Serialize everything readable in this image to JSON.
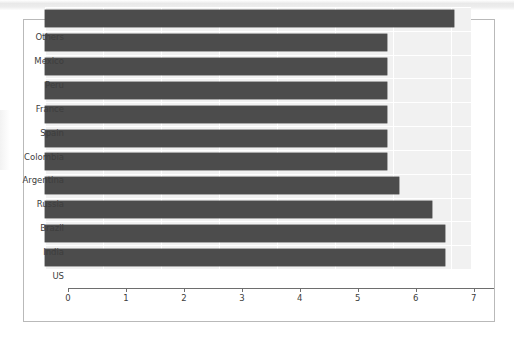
{
  "chart_data": {
    "type": "bar",
    "orientation": "horizontal",
    "title": "Common Log : of Coronavirus Confirmed Cases in Countries/Regions",
    "xlabel": "",
    "ylabel": "",
    "xlim": [
      0,
      7.35
    ],
    "xticks": [
      "0",
      "1",
      "2",
      "3",
      "4",
      "5",
      "6",
      "7"
    ],
    "xtick_values": [
      0,
      1,
      2,
      3,
      4,
      5,
      6,
      7
    ],
    "categories": [
      "Others",
      "Mexico",
      "Peru",
      "France",
      "Spain",
      "Colombia",
      "Argentina",
      "Russia",
      "Brazil",
      "India",
      "US"
    ],
    "values": [
      7.05,
      5.9,
      5.9,
      5.9,
      5.9,
      5.9,
      5.9,
      6.1,
      6.68,
      6.91,
      6.91
    ],
    "grid": true,
    "legend": null,
    "bar_color": "#4c4c4c",
    "plot_background": "#f1f1f1",
    "gridline_color": "#ffffff",
    "axis_color": "#6e6e6e",
    "frame_border_color": "#b9b9b9"
  }
}
